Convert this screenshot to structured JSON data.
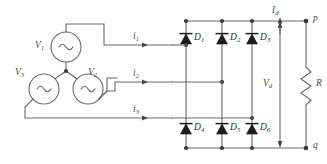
{
  "diagram": {
    "type": "circuit-schematic"
  },
  "sources": {
    "v1_label": "V",
    "v1_sub": "1",
    "v2_label": "V",
    "v2_sub": "2",
    "v3_label": "V",
    "v3_sub": "3",
    "icon": "ac-source-icon",
    "connection": "wye"
  },
  "currents": {
    "i1_label": "i",
    "i1_sub": "1",
    "i2_label": "i",
    "i2_sub": "2",
    "i3_label": "i",
    "i3_sub": "3",
    "id_label": "I",
    "id_sub": "d"
  },
  "diodes": [
    {
      "label": "D",
      "sub": "1",
      "row": "upper",
      "column": 1
    },
    {
      "label": "D",
      "sub": "2",
      "row": "upper",
      "column": 2
    },
    {
      "label": "D",
      "sub": "3",
      "row": "upper",
      "column": 3
    },
    {
      "label": "D",
      "sub": "4",
      "row": "lower",
      "column": 1
    },
    {
      "label": "D",
      "sub": "5",
      "row": "lower",
      "column": 2
    },
    {
      "label": "D",
      "sub": "6",
      "row": "lower",
      "column": 3
    }
  ],
  "output": {
    "vd_label": "V",
    "vd_sub": "d",
    "terminal_p": "p",
    "terminal_q": "q",
    "resistor_label": "R"
  },
  "colors": {
    "wire": "#6b6b6b",
    "diode": "#1c1c1c",
    "text": "#4a4a4a",
    "background": "#ffffff"
  }
}
